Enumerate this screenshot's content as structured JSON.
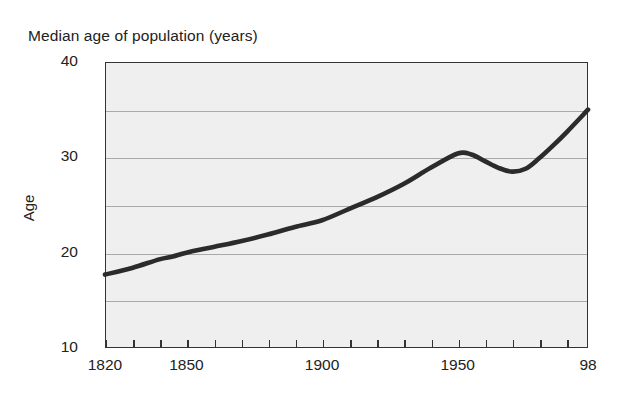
{
  "chart_data": {
    "type": "line",
    "title": "Median age of population (years)",
    "xlabel": "",
    "ylabel": "Age",
    "xlim": [
      1820,
      1998
    ],
    "ylim": [
      10,
      40
    ],
    "yticks": [
      10,
      20,
      30,
      40
    ],
    "ytick_labels": [
      "10",
      "20",
      "30",
      "40"
    ],
    "gridlines_y": [
      15,
      20,
      25,
      30,
      35
    ],
    "grid": true,
    "legend": null,
    "xticks": [
      1820,
      1830,
      1840,
      1850,
      1860,
      1870,
      1880,
      1890,
      1900,
      1910,
      1920,
      1930,
      1940,
      1950,
      1960,
      1970,
      1980,
      1990,
      1998
    ],
    "xtick_labels": [
      {
        "x": 1820,
        "label": "1820"
      },
      {
        "x": 1850,
        "label": "1850"
      },
      {
        "x": 1900,
        "label": "1900"
      },
      {
        "x": 1950,
        "label": "1950"
      },
      {
        "x": 1998,
        "label": "98"
      }
    ],
    "series": [
      {
        "name": "Median age of population",
        "color": "#2b2b2b",
        "x": [
          1820,
          1830,
          1840,
          1845,
          1850,
          1860,
          1870,
          1880,
          1890,
          1900,
          1910,
          1920,
          1930,
          1940,
          1950,
          1955,
          1960,
          1965,
          1970,
          1975,
          1980,
          1985,
          1990,
          1998
        ],
        "values": [
          17.7,
          18.4,
          19.3,
          19.6,
          20.0,
          20.6,
          21.2,
          21.9,
          22.7,
          23.4,
          24.6,
          25.8,
          27.2,
          28.9,
          30.4,
          30.3,
          29.6,
          28.9,
          28.5,
          28.8,
          29.9,
          31.2,
          32.6,
          35.0
        ]
      }
    ],
    "annotations": [
      {
        "text": "slight step in trend near 1845",
        "x": 1845,
        "y": 19.6
      }
    ]
  },
  "figure": {
    "background_color": "#ffffff",
    "plot_background_color": "#efefef",
    "frame_color": "#333333",
    "gridline_color": "#a9a9a9",
    "line_color": "#2b2b2b"
  }
}
